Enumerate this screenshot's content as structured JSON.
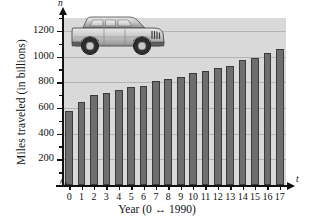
{
  "chart_data": {
    "type": "bar",
    "title": "",
    "xlabel": "Year (0 ↔ 1990)",
    "ylabel": "Miles traveled (in billions)",
    "x_axis_variable": "t",
    "y_axis_variable": "n",
    "categories": [
      "0",
      "1",
      "2",
      "3",
      "4",
      "5",
      "6",
      "7",
      "8",
      "9",
      "10",
      "11",
      "12",
      "13",
      "14",
      "15",
      "16",
      "17"
    ],
    "values": [
      575,
      650,
      700,
      715,
      740,
      760,
      770,
      810,
      825,
      840,
      870,
      890,
      910,
      930,
      975,
      985,
      1030,
      1055
    ],
    "ylim": [
      0,
      1300
    ],
    "ytick_labels": [
      "200",
      "400",
      "600",
      "800",
      "1000",
      "1200"
    ],
    "ytick_values": [
      200,
      400,
      600,
      800,
      1000,
      1200
    ],
    "ytick_minor_values": [
      100,
      300,
      500,
      700,
      900,
      1100,
      1300
    ],
    "gridlines": true,
    "legend": "none",
    "bar_color": "#6e6e6e",
    "bar_border_color": "#3a3a3a",
    "plot_background": "#d8d8d8",
    "gridline_color": "#b4b4b4",
    "axis_color": "#111111"
  },
  "decoration": {
    "image_name": "suv-illustration",
    "description": "Sport utility vehicle"
  }
}
